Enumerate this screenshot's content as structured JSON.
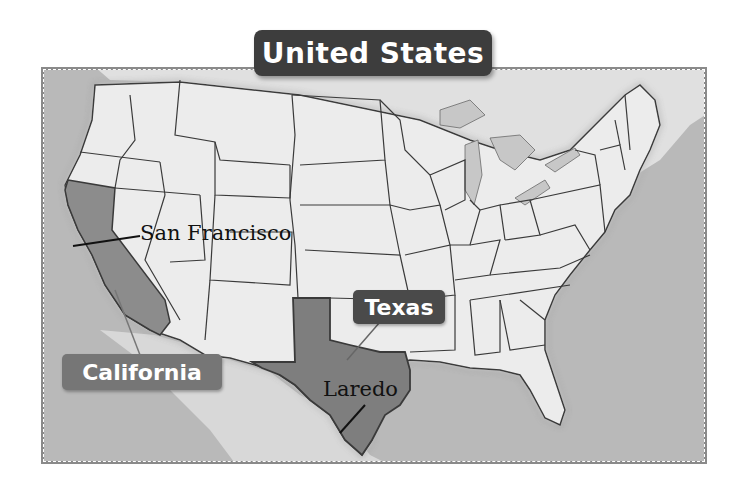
{
  "title": "United States",
  "state_labels": {
    "california": "California",
    "texas": "Texas"
  },
  "city_labels": {
    "san_francisco": "San Francisco",
    "laredo": "Laredo"
  },
  "colors": {
    "ocean": "#b7b7b7",
    "land": "#ececec",
    "highlight_state_california": "#8c8c8c",
    "highlight_state_texas": "#7e7e7e",
    "title_badge": "#3d3d3d",
    "california_badge": "#767676",
    "texas_badge": "#4a4a4a",
    "state_border": "#3a3a3a"
  }
}
